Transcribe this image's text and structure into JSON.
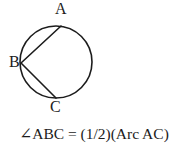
{
  "figure": {
    "type": "geometry-diagram",
    "background_color": "#ffffff",
    "stroke_color": "#1c1c1c",
    "text_color": "#1c1c1c"
  },
  "circle": {
    "center_x": 56,
    "center_y": 62,
    "radius": 36,
    "stroke_width": 1.6,
    "fill": "none"
  },
  "points": {
    "A": {
      "label": "A",
      "x": 61,
      "y": 26,
      "label_x": 55,
      "label_y": 1
    },
    "B": {
      "label": "B",
      "x": 21,
      "y": 63,
      "label_x": 9,
      "label_y": 54
    },
    "C": {
      "label": "C",
      "x": 56,
      "y": 98,
      "label_x": 50,
      "label_y": 99
    }
  },
  "chords": [
    {
      "name": "chord-BA",
      "from": "B",
      "to": "A"
    },
    {
      "name": "chord-BC",
      "from": "B",
      "to": "C"
    }
  ],
  "caption": {
    "text": "∠ABC = (1/2)(Arc AC)",
    "angle_symbol": "∠",
    "angle_name": "ABC",
    "equals": "=",
    "coefficient": "(1/2)",
    "arc_term": "(Arc AC)"
  }
}
